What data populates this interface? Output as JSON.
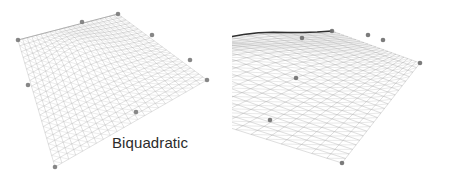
{
  "figure": {
    "width": 464,
    "height": 178,
    "background_color": "#ffffff"
  },
  "panels": [
    {
      "id": "biquadratic",
      "caption": "Biquadratic",
      "caption_color": "#2b2b2b",
      "mesh_color": "#b9b9b9",
      "mesh_rows": 22,
      "mesh_cols": 22,
      "control_point_color": "#7a7a7a",
      "control_point_count": 9,
      "silhouette_color": "#9a9a9a"
    },
    {
      "id": "bicubic",
      "caption": "Bicubic",
      "caption_color": "#2b2b2b",
      "mesh_color": "#b0b0b0",
      "mesh_rows": 22,
      "mesh_cols": 22,
      "control_point_color": "#6e6e6e",
      "control_point_count": 11,
      "silhouette_color": "#303030"
    }
  ],
  "chart_data": {
    "type": "surface-mesh-comparison",
    "title": "",
    "xlabel": "",
    "ylabel": "",
    "legend_position": "none",
    "grid": false,
    "surfaces": [
      {
        "name": "Biquadratic",
        "interpolation": "biquadratic",
        "grid_resolution": [
          22,
          22
        ],
        "note": "Smooth single-peak surface; gentle ridge near the upper-left, monotone falloff toward the lower vertex",
        "control_points": [
          {
            "x": 18,
            "y": 40
          },
          {
            "x": 82,
            "y": 22
          },
          {
            "x": 118,
            "y": 14
          },
          {
            "x": 152,
            "y": 35
          },
          {
            "x": 207,
            "y": 80
          },
          {
            "x": 28,
            "y": 85
          },
          {
            "x": 55,
            "y": 167
          },
          {
            "x": 136,
            "y": 112
          },
          {
            "x": 190,
            "y": 60
          }
        ],
        "outline": [
          {
            "x": 18,
            "y": 40
          },
          {
            "x": 118,
            "y": 14
          },
          {
            "x": 207,
            "y": 80
          },
          {
            "x": 55,
            "y": 167
          }
        ]
      },
      {
        "name": "Bicubic",
        "interpolation": "bicubic",
        "grid_resolution": [
          22,
          22
        ],
        "note": "Surface shows overshoot ripples along the far edge producing a dark wavy silhouette at the upper left",
        "control_points": [
          {
            "x": 8,
            "y": 58
          },
          {
            "x": 64,
            "y": 36
          },
          {
            "x": 302,
            "y": 38
          },
          {
            "x": 332,
            "y": 31
          },
          {
            "x": 368,
            "y": 35
          },
          {
            "x": 383,
            "y": 40
          },
          {
            "x": 420,
            "y": 63
          },
          {
            "x": 296,
            "y": 78
          },
          {
            "x": 342,
            "y": 163
          },
          {
            "x": 178,
            "y": 110
          },
          {
            "x": 270,
            "y": 120
          }
        ],
        "outline": [
          {
            "x": 8,
            "y": 58
          },
          {
            "x": 332,
            "y": 31
          },
          {
            "x": 420,
            "y": 63
          },
          {
            "x": 342,
            "y": 163
          }
        ]
      }
    ]
  }
}
